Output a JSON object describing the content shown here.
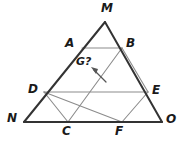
{
  "figure": {
    "kind": "geometry-diagram",
    "colors": {
      "outline": "#333333",
      "interior": "#8c8c8c",
      "label": "#1a1a1a",
      "background": "#ffffff"
    },
    "stroke_widths": {
      "outline": 2.0,
      "interior": 1.1,
      "arrow": 1.2
    },
    "vertices": [
      {
        "name": "M",
        "label": "M",
        "x": 105,
        "y": 22,
        "label_x": 101,
        "label_y": 2,
        "role": "apex"
      },
      {
        "name": "N",
        "label": "N",
        "x": 24,
        "y": 122,
        "label_x": 7,
        "label_y": 112,
        "role": "base-left"
      },
      {
        "name": "O",
        "label": "O",
        "x": 162,
        "y": 122,
        "label_x": 166,
        "label_y": 113,
        "role": "base-right"
      },
      {
        "name": "A",
        "label": "A",
        "x": 82,
        "y": 48,
        "label_x": 65,
        "label_y": 37,
        "role": "point-on-MN"
      },
      {
        "name": "B",
        "label": "B",
        "x": 122,
        "y": 48,
        "label_x": 126,
        "label_y": 37,
        "role": "point-on-MO"
      },
      {
        "name": "D",
        "label": "D",
        "x": 44,
        "y": 92,
        "label_x": 28,
        "label_y": 83,
        "role": "midpoint-MN"
      },
      {
        "name": "E",
        "label": "E",
        "x": 148,
        "y": 92,
        "label_x": 152,
        "label_y": 84,
        "role": "midpoint-MO"
      },
      {
        "name": "C",
        "label": "C",
        "x": 68,
        "y": 122,
        "label_x": 62,
        "label_y": 125,
        "role": "point-on-NO"
      },
      {
        "name": "F",
        "label": "F",
        "x": 122,
        "y": 122,
        "label_x": 115,
        "label_y": 125,
        "role": "point-on-NO"
      },
      {
        "name": "G",
        "label": "G?",
        "x": 93,
        "y": 68,
        "label_x": 76,
        "label_y": 56,
        "role": "unknown-point"
      }
    ],
    "outline_edges": [
      {
        "name": "edge-MN",
        "from": "M",
        "to": "N"
      },
      {
        "name": "edge-MO",
        "from": "M",
        "to": "O"
      },
      {
        "name": "edge-NO",
        "from": "N",
        "to": "O"
      }
    ],
    "interior_segments": [
      {
        "name": "segment-AB",
        "from": "A",
        "to": "B"
      },
      {
        "name": "segment-DE",
        "from": "D",
        "to": "E"
      },
      {
        "name": "segment-DC",
        "from": "D",
        "to": "C"
      },
      {
        "name": "segment-CB",
        "from": "C",
        "to": "B"
      },
      {
        "name": "segment-BF",
        "from": "B",
        "to": "F"
      },
      {
        "name": "segment-FE",
        "from": "F",
        "to": "E"
      },
      {
        "name": "segment-DF",
        "from": "D",
        "to": "F"
      }
    ],
    "arrow": {
      "name": "pointer-to-G",
      "from_x": 106,
      "from_y": 82,
      "to_x": 92,
      "to_y": 68,
      "head_size": 4.5
    },
    "annotation": {
      "question_mark_label": "G?"
    }
  }
}
